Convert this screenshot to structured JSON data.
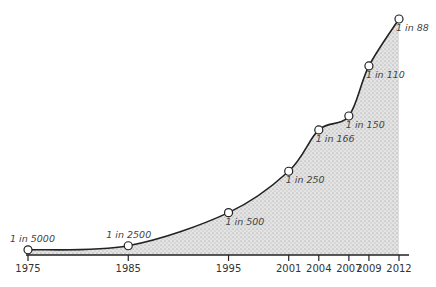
{
  "chart_data": {
    "type": "area",
    "title": "",
    "xlabel": "",
    "ylabel": "",
    "grid": false,
    "legend": null,
    "x": [
      1975,
      1985,
      1995,
      2001,
      2004,
      2007,
      2009,
      2012
    ],
    "tick_labels": [
      "1975",
      "1985",
      "1995",
      "2001",
      "2004",
      "2007",
      "2009",
      "2012"
    ],
    "point_labels": [
      "1 in 5000",
      "1 in 2500",
      "1 in 500",
      "1 in 250",
      "1 in 166",
      "1 in 150",
      "1 in 110",
      "1 in 88"
    ],
    "values_one_in": [
      5000,
      2500,
      500,
      250,
      166,
      150,
      110,
      88
    ],
    "values_rate": [
      0.0002,
      0.0004,
      0.002,
      0.004,
      0.006,
      0.00667,
      0.00909,
      0.01136
    ],
    "colors": {
      "line": "#222222",
      "fill": "#d8d8d8",
      "marker_fill": "#ffffff",
      "axis": "#222222"
    }
  }
}
